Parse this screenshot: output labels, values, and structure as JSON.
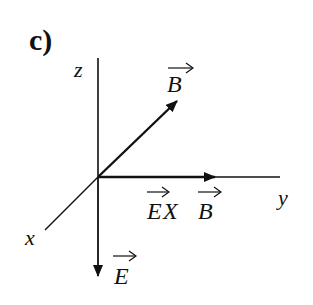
{
  "panel_label": "c)",
  "axes": {
    "z_label": "z",
    "y_label": "y",
    "x_label": "x"
  },
  "vectors": {
    "B": {
      "label": "B",
      "arrow_mark": "→",
      "direction": "up-right"
    },
    "ExB": {
      "label_e": "E",
      "cross": "X",
      "label_b": "B",
      "direction": "+y"
    },
    "E": {
      "label": "E",
      "arrow_mark": "→",
      "direction": "down"
    }
  },
  "colors": {
    "ink": "#111111",
    "background": "#ffffff"
  }
}
